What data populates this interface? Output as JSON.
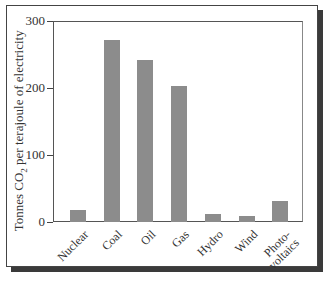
{
  "chart_data": {
    "type": "bar",
    "title": "",
    "xlabel": "",
    "ylabel": "Tonnes CO2 per terajoule of electricity",
    "ylabel_parts": {
      "pre": "Tonnes CO",
      "sub": "2",
      "post": " per terajoule of electricity"
    },
    "categories": [
      "Nuclear",
      "Coal",
      "Oil",
      "Gas",
      "Hydro",
      "Wind",
      "Photo-voltaics"
    ],
    "category_labels": [
      [
        "Nuclear"
      ],
      [
        "Coal"
      ],
      [
        "Oil"
      ],
      [
        "Gas"
      ],
      [
        "Hydro"
      ],
      [
        "Wind"
      ],
      [
        "Photo-",
        "voltaics"
      ]
    ],
    "values": [
      18,
      271,
      242,
      203,
      12,
      9,
      31
    ],
    "ylim": [
      0,
      300
    ],
    "yticks": [
      0,
      100,
      200,
      300
    ],
    "ytick_labels": [
      "0",
      "100",
      "200",
      "300"
    ],
    "grid": false,
    "legend": null,
    "bar_color": "#8c8c8c"
  }
}
